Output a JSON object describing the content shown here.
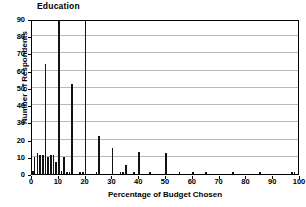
{
  "chart_data": {
    "type": "bar",
    "title": "Education",
    "xlabel": "Percentage of Budget Chosen",
    "ylabel": "Number of Respondents",
    "xlim": [
      0,
      100
    ],
    "ylim": [
      0,
      90
    ],
    "xticks": [
      0,
      10,
      20,
      30,
      40,
      50,
      60,
      70,
      80,
      90,
      100
    ],
    "yticks": [
      0,
      10,
      20,
      30,
      40,
      50,
      60,
      70,
      80,
      90
    ],
    "grid": "horizontal",
    "legend": "none",
    "bar_color": "#111111",
    "x": [
      0,
      1,
      2,
      3,
      4,
      5,
      6,
      7,
      8,
      9,
      10,
      11,
      12,
      13,
      14,
      15,
      16,
      17,
      18,
      19,
      20,
      21,
      22,
      23,
      24,
      25,
      26,
      27,
      28,
      29,
      30,
      31,
      32,
      33,
      34,
      35,
      36,
      37,
      38,
      39,
      40,
      41,
      42,
      43,
      44,
      45,
      46,
      47,
      48,
      49,
      50,
      51,
      52,
      53,
      54,
      55,
      56,
      57,
      58,
      59,
      60,
      61,
      62,
      63,
      64,
      65,
      66,
      67,
      68,
      69,
      70,
      71,
      72,
      73,
      74,
      75,
      76,
      77,
      78,
      79,
      80,
      81,
      82,
      83,
      84,
      85,
      86,
      87,
      88,
      89,
      90,
      91,
      92,
      93,
      94,
      95,
      96,
      97,
      98,
      99,
      100
    ],
    "values": [
      2,
      10,
      12,
      11,
      11,
      64,
      10,
      11,
      11,
      7,
      90,
      2,
      10,
      1,
      1,
      52,
      0,
      0,
      1,
      1,
      90,
      0,
      0,
      0,
      1,
      22,
      0,
      0,
      0,
      0,
      15,
      0,
      0,
      1,
      1,
      5,
      0,
      0,
      1,
      0,
      13,
      0,
      0,
      0,
      1,
      0,
      0,
      0,
      0,
      0,
      12,
      0,
      0,
      0,
      0,
      1,
      0,
      0,
      0,
      0,
      1,
      0,
      0,
      0,
      0,
      1,
      0,
      0,
      0,
      0,
      0,
      0,
      0,
      0,
      0,
      1,
      0,
      0,
      0,
      0,
      0,
      0,
      0,
      0,
      0,
      1,
      0,
      0,
      0,
      0,
      0,
      0,
      0,
      0,
      0,
      0,
      0,
      1,
      1,
      0,
      1
    ]
  }
}
